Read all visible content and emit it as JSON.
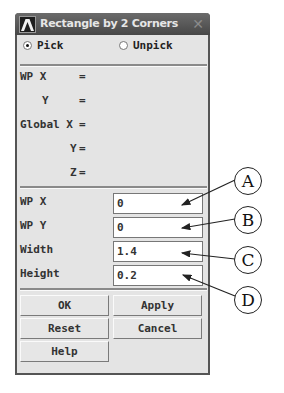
{
  "dialog": {
    "title": "Rectangle by 2 Corners",
    "close_glyph": "✕",
    "mode": {
      "pick_label": "Pick",
      "unpick_label": "Unpick",
      "selected": "Pick"
    },
    "readout": {
      "wp_x_label": "WP X",
      "wp_y_label": "Y",
      "global_x_label": "Global X",
      "global_y_label": "Y",
      "global_z_label": "Z",
      "equals": "="
    },
    "fields": [
      {
        "label": "WP X",
        "value": "0"
      },
      {
        "label": "WP Y",
        "value": "0"
      },
      {
        "label": "Width",
        "value": "1.4"
      },
      {
        "label": "Height",
        "value": "0.2"
      }
    ],
    "buttons": {
      "ok": "OK",
      "apply": "Apply",
      "reset": "Reset",
      "cancel": "Cancel",
      "help": "Help"
    }
  },
  "callouts": [
    "A",
    "B",
    "C",
    "D"
  ],
  "icons": {
    "app": "ansys-logo-icon",
    "close": "close-icon"
  }
}
